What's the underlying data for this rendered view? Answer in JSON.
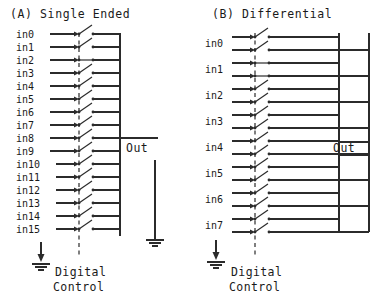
{
  "figure": {
    "background_color": "#ffffff",
    "line_color": "#2b2b2b",
    "text_color": "#1a1a1a",
    "width": 370,
    "height": 300
  },
  "panels": [
    {
      "id": "single-ended",
      "title": "(A) Single Ended",
      "mux_type": "single-ended",
      "input_count": 16,
      "lines_per_input": 1,
      "bus_rails": 1,
      "inputs": [
        "in0",
        "in1",
        "in2",
        "in3",
        "in4",
        "in5",
        "in6",
        "in7",
        "in8",
        "in9",
        "in10",
        "in11",
        "in12",
        "in13",
        "in14",
        "in15"
      ],
      "closed_switch_index": 2,
      "output_label": "Out",
      "output_count": 1,
      "control_label_line1": "Digital",
      "control_label_line2": "Control",
      "ground_symbols": 2
    },
    {
      "id": "differential",
      "title": "(B) Differential",
      "mux_type": "differential",
      "input_count": 8,
      "lines_per_input": 2,
      "bus_rails": 2,
      "inputs": [
        "in0",
        "in1",
        "in2",
        "in3",
        "in4",
        "in5",
        "in6",
        "in7"
      ],
      "closed_switch_index": 1,
      "output_label": "Out",
      "output_count": 2,
      "control_label_line1": "Digital",
      "control_label_line2": "Control",
      "ground_symbols": 1
    }
  ]
}
